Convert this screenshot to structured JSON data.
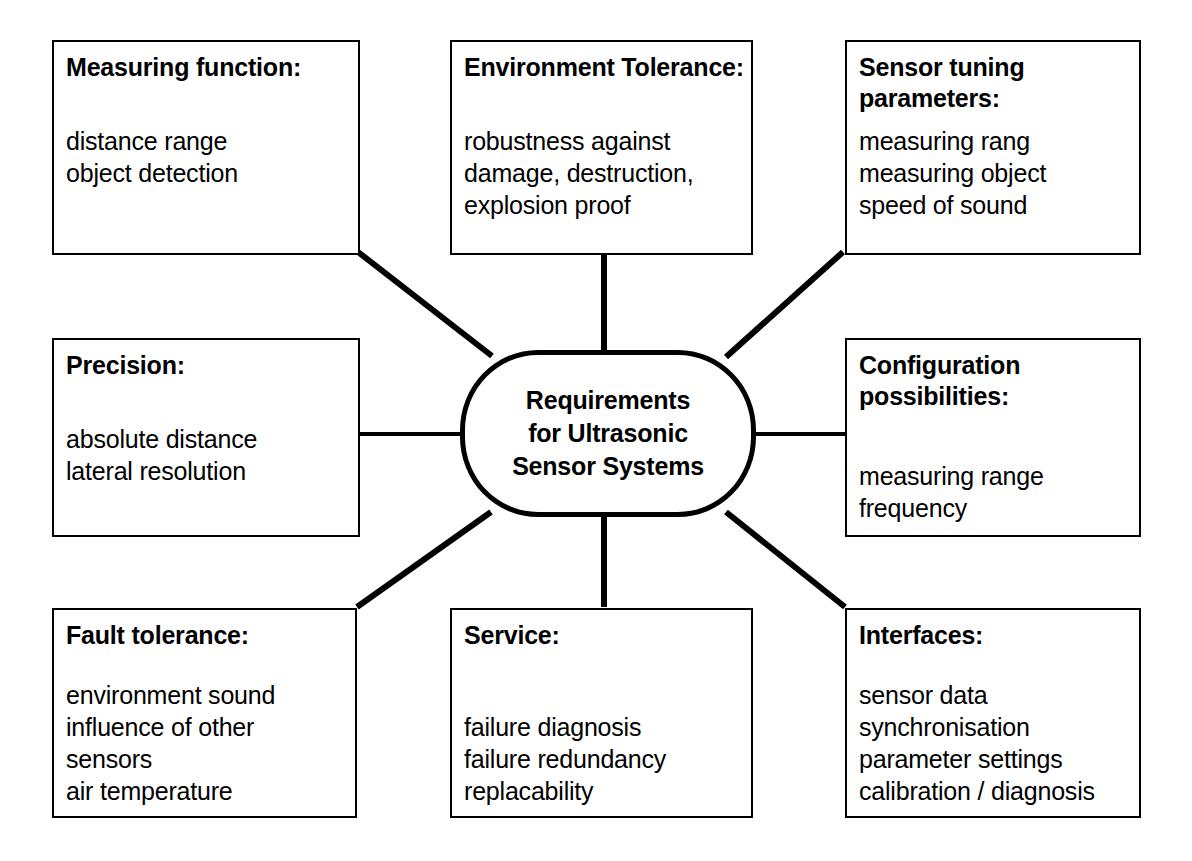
{
  "diagram": {
    "type": "mind-map",
    "center": {
      "label": "Requirements\nfor Ultrasonic\nSensor Systems"
    },
    "nodes": [
      {
        "id": "measuring-function",
        "title": "Measuring function:",
        "items": [
          "distance range",
          "object detection"
        ],
        "position": "top-left",
        "connector": "diagonal"
      },
      {
        "id": "environment-tolerance",
        "title": "Environment Tolerance:",
        "items": [
          "robustness against",
          "damage, destruction,",
          "explosion proof"
        ],
        "position": "top-center",
        "connector": "vertical"
      },
      {
        "id": "sensor-tuning",
        "title": "Sensor tuning\nparameters:",
        "items": [
          "measuring rang",
          "measuring object",
          "speed of sound"
        ],
        "position": "top-right",
        "connector": "diagonal"
      },
      {
        "id": "precision",
        "title": "Precision:",
        "items": [
          "absolute distance",
          "lateral resolution"
        ],
        "position": "middle-left",
        "connector": "horizontal"
      },
      {
        "id": "configuration",
        "title": "Configuration\npossibilities:",
        "items": [
          "measuring range",
          "frequency"
        ],
        "position": "middle-right",
        "connector": "horizontal"
      },
      {
        "id": "fault-tolerance",
        "title": "Fault tolerance:",
        "items": [
          "environment sound",
          "influence of other",
          "sensors",
          "air temperature"
        ],
        "position": "bottom-left",
        "connector": "diagonal"
      },
      {
        "id": "service",
        "title": "Service:",
        "items": [
          "failure diagnosis",
          "failure redundancy",
          "replacability"
        ],
        "position": "bottom-center",
        "connector": "vertical"
      },
      {
        "id": "interfaces",
        "title": "Interfaces:",
        "items": [
          "sensor data",
          "synchronisation",
          "parameter settings",
          "calibration / diagnosis"
        ],
        "position": "bottom-right",
        "connector": "diagonal"
      }
    ],
    "colors": {
      "line": "#000000",
      "background": "#ffffff",
      "text": "#000000"
    }
  }
}
